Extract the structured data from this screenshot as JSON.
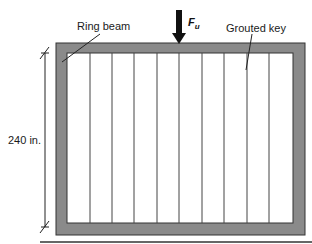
{
  "diagram": {
    "labels": {
      "ring_beam": "Ring beam",
      "grouted_key": "Grouted key",
      "dimension": "240 in.",
      "force_main": "F",
      "force_sub": "u"
    },
    "colors": {
      "ring_beam_fill": "#8a8a8a",
      "panel_fill": "#ffffff",
      "line": "#333333",
      "arrow": "#111111"
    },
    "panel_count": 10,
    "grouted_key_count": 9
  }
}
